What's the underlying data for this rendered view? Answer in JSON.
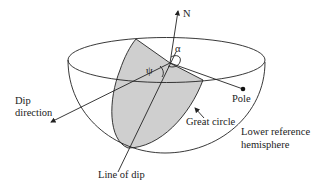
{
  "diagram": {
    "labels": {
      "north": "N",
      "alpha": "α",
      "psi": "ψ",
      "dip_direction_line1": "Dip",
      "dip_direction_line2": "direction",
      "pole": "Pole",
      "great_circle": "Great circle",
      "hemisphere_line1": "Lower reference",
      "hemisphere_line2": "hemisphere",
      "line_of_dip": "Line of dip"
    },
    "colors": {
      "stroke": "#222222",
      "shade": "#cfcfcf",
      "background": "#ffffff"
    }
  }
}
